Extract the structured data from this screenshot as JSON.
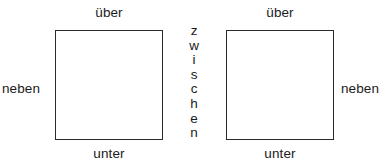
{
  "diagram": {
    "background_color": "#ffffff",
    "stroke_color": "#2b2b2b",
    "text_color": "#1a1a1a",
    "shapes": [
      {
        "name": "left-square",
        "label": ""
      },
      {
        "name": "right-square",
        "label": ""
      }
    ],
    "labels": {
      "ueber_left": "über",
      "unter_left": "unter",
      "neben_left": "neben",
      "ueber_right": "über",
      "unter_right": "unter",
      "neben_right": "neben",
      "zwischen": "zwischen",
      "zwischen_letters": [
        "z",
        "w",
        "i",
        "s",
        "c",
        "h",
        "e",
        "n"
      ]
    }
  }
}
